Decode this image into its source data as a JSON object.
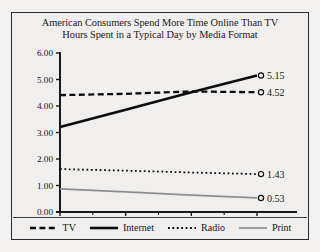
{
  "chart_data": {
    "type": "line",
    "title": "American Consumers Spend More Time Online Than TV",
    "subtitle": "Hours Spent in a Typical Day by Media Format",
    "xlabel": "",
    "ylabel": "",
    "categories": [
      "2010",
      "2011",
      "2012",
      "2013"
    ],
    "x": [
      2010,
      2011,
      2012,
      2013
    ],
    "ylim": [
      0.0,
      6.0
    ],
    "ytick_step": 1.0,
    "ytick_labels": [
      "0.00",
      "1.00",
      "2.00",
      "3.00",
      "4.00",
      "5.00",
      "6.00"
    ],
    "ytick_values": [
      0.0,
      1.0,
      2.0,
      3.0,
      4.0,
      5.0,
      6.0
    ],
    "grid": false,
    "legend_position": "bottom",
    "endpoint_markers": "open-circle",
    "series": [
      {
        "name": "TV",
        "values": [
          4.41,
          4.46,
          4.55,
          4.52
        ],
        "end_label": "4.52",
        "style": "dashed",
        "color": "#0d0d0d",
        "width": 2.3
      },
      {
        "name": "Internet",
        "values": [
          3.21,
          3.86,
          4.52,
          5.15
        ],
        "end_label": "5.15",
        "style": "solid",
        "color": "#0d0d0d",
        "width": 2.6
      },
      {
        "name": "Radio",
        "values": [
          1.62,
          1.56,
          1.49,
          1.43
        ],
        "end_label": "1.43",
        "style": "dotted",
        "color": "#0d0d0d",
        "width": 1.8
      },
      {
        "name": "Print",
        "values": [
          0.87,
          0.76,
          0.64,
          0.53
        ],
        "end_label": "0.53",
        "style": "solid",
        "color": "#8d8d8d",
        "width": 1.7
      }
    ]
  },
  "legend": {
    "items": [
      {
        "label": "TV"
      },
      {
        "label": "Internet"
      },
      {
        "label": "Radio"
      },
      {
        "label": "Print"
      }
    ]
  },
  "colors": {
    "background": "#f0efed",
    "border": "#2b2b2b",
    "axis": "#1a1a1a",
    "text": "#141414",
    "print_series": "#8d8d8d"
  }
}
